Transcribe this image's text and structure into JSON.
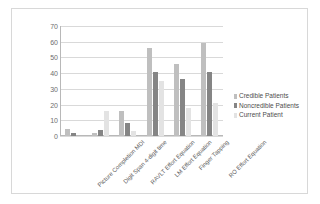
{
  "chart_data": {
    "type": "bar",
    "title": "",
    "xlabel": "",
    "ylabel": "",
    "ylim": [
      0,
      70
    ],
    "yticks": [
      0,
      10,
      20,
      30,
      40,
      50,
      60,
      70
    ],
    "grid": true,
    "legend_position": "right",
    "categories": [
      "Picture Completion MDI",
      "Digit Span 4-digit time",
      "RAVLT Effort Equation",
      "LM Effort Equation",
      "Finger Tapping",
      "RO Effort Equation"
    ],
    "series": [
      {
        "name": "Credible Patients",
        "color": "#bfbfbf",
        "values": [
          4.5,
          2,
          16,
          56,
          46,
          59
        ]
      },
      {
        "name": "Noncredible Patients",
        "color": "#858585",
        "values": [
          2,
          4,
          8.5,
          41,
          36,
          41
        ]
      },
      {
        "name": "Current Patient",
        "color": "#e3e3e3",
        "values": [
          0,
          16,
          3.5,
          35,
          18,
          21
        ]
      }
    ]
  },
  "axis": {
    "y_tick_labels": [
      "70",
      "60",
      "50",
      "40",
      "30",
      "20",
      "10",
      "0"
    ]
  },
  "legend": {
    "items": [
      {
        "label": "Credible Patients",
        "color": "#bfbfbf"
      },
      {
        "label": "Noncredible Patients",
        "color": "#858585"
      },
      {
        "label": "Current Patient",
        "color": "#e3e3e3"
      }
    ]
  },
  "colors": {
    "frame_border": "#d8d8d8",
    "gridline": "#d9d9d9",
    "axis_line": "#b8b8b8",
    "tick_text": "#6e6e6e",
    "label_text": "#606060",
    "legend_text": "#4d4d4d",
    "background": "#ffffff"
  }
}
